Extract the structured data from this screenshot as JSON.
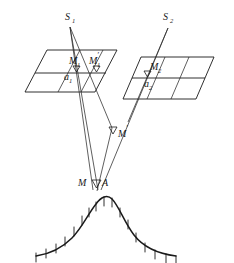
{
  "figure": {
    "type": "geometry-diagram",
    "background_color": "#ffffff",
    "line_color": "#1a1a1a",
    "width": 234,
    "height": 263
  },
  "labels": {
    "source_1": {
      "base": "S",
      "sub": "1",
      "prime": "",
      "x": 66,
      "y": 17
    },
    "source_2": {
      "base": "S",
      "sub": "2",
      "prime": "",
      "x": 165,
      "y": 17
    },
    "point_m1": {
      "base": "M",
      "sub": "1",
      "prime": "′",
      "x": 72,
      "y": 62
    },
    "point_m1_prime": {
      "base": "M",
      "sub": "1",
      "prime": "′",
      "x": 94,
      "y": 62
    },
    "point_m2": {
      "base": "M",
      "sub": "2",
      "prime": "",
      "x": 153,
      "y": 68
    },
    "plane_a1": {
      "base": "a",
      "sub": "1",
      "prime": "",
      "x": 66,
      "y": 78
    },
    "plane_a2": {
      "base": "a",
      "sub": "2",
      "prime": "",
      "x": 146,
      "y": 85
    },
    "point_m_prime": {
      "base": "M",
      "sub": "",
      "prime": "′",
      "x": 120,
      "y": 139
    },
    "point_m": {
      "base": "M",
      "sub": "",
      "prime": "",
      "x": 79,
      "y": 183
    },
    "point_a": {
      "base": "A",
      "sub": "",
      "prime": "",
      "x": 103,
      "y": 183
    }
  },
  "planes": [
    {
      "name": "plane-a1",
      "label": "a1",
      "outline": "25,92 47,50 117,50 95,92",
      "middle_line": "35,73 106,73",
      "vertical_lines": [
        "58,92 80,50",
        "81,92 103,50"
      ]
    },
    {
      "name": "plane-a2",
      "label": "a2",
      "outline": "123,99 141,57 214,57 196,99",
      "middle_line": "132,78 205,78",
      "vertical_lines": [
        "147,99 165,57",
        "171,99 189,57"
      ]
    }
  ],
  "rays": {
    "from_source_1": [
      "70,27 93,190",
      "70,27 110,123",
      "70,27 97,190"
    ],
    "from_source_2": [
      "168,28 143,99",
      "168,28 100,190"
    ],
    "through_m_prime": "110,123 100,190"
  },
  "markers": [
    {
      "name": "marker-m1",
      "x": 76,
      "y": 67
    },
    {
      "name": "marker-m1-prime",
      "x": 96,
      "y": 67
    },
    {
      "name": "marker-m2",
      "x": 147,
      "y": 72
    },
    {
      "name": "marker-m-prime",
      "x": 113,
      "y": 132
    },
    {
      "name": "marker-m-a",
      "x": 96,
      "y": 184
    }
  ],
  "terrain": {
    "name": "hill-profile",
    "curve": "M 36,256 C 50,254 62,248 72,238 C 82,228 88,214 96,204 C 101,197 107,194 112,199 C 119,206 124,222 134,235 C 144,248 160,254 176,256",
    "hatch_ticks": [
      "36,252 36,262",
      "46,248 46,258",
      "56,243 56,253",
      "65,236 65,246",
      "74,226 74,236",
      "82,214 82,224",
      "89,207 89,217",
      "96,202 96,212",
      "104,199 104,209",
      "112,200 112,210",
      "120,209 120,219",
      "128,222 128,232",
      "136,234 136,244",
      "145,243 145,253",
      "155,250 155,260",
      "166,254 166,264",
      "176,255 176,265"
    ]
  }
}
